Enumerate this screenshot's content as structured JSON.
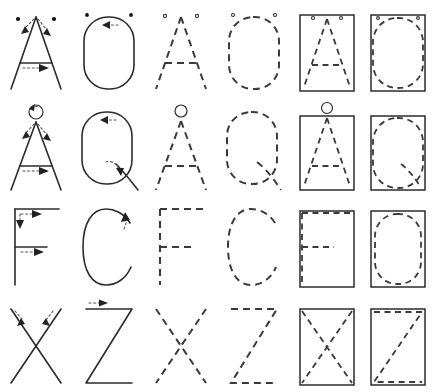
{
  "sheet": {
    "title": "Letter formation practice grid",
    "description": "Six-column by four-row worksheet showing capital letter stroke-order diagrams",
    "background_color": "#ffffff",
    "ink_color": "#2b2b2b",
    "dash_color": "#3a3a3a",
    "columns": 6,
    "rows": 4,
    "column_styles": [
      "solid-with-arrows",
      "solid-with-arrows",
      "dashed-outline",
      "dashed-outline",
      "boxed-dashed",
      "boxed-dashed"
    ]
  },
  "rows": [
    {
      "row_label": "row-1",
      "cells": [
        {
          "name": "cell-r1c1",
          "letter": "A",
          "style": "solid-with-arrows",
          "marks": "two dots at apex, two downward arrows, rightward arrow on crossbar"
        },
        {
          "name": "cell-r1c2",
          "letter": "O",
          "style": "solid-with-arrows",
          "marks": "two dots at top, leftward arrow at top"
        },
        {
          "name": "cell-r1c3",
          "letter": "A",
          "style": "dashed-outline",
          "marks": "two small dots at apex"
        },
        {
          "name": "cell-r1c4",
          "letter": "O",
          "style": "dashed-outline",
          "marks": "two small dots at top"
        },
        {
          "name": "cell-r1c5",
          "letter": "A",
          "style": "boxed-dashed",
          "marks": "solid rectangle frame with dashed letter"
        },
        {
          "name": "cell-r1c6",
          "letter": "O",
          "style": "boxed-dashed",
          "marks": "solid rectangle frame with dashed letter"
        }
      ]
    },
    {
      "row_label": "row-2",
      "cells": [
        {
          "name": "cell-r2c1",
          "letter": "Å",
          "style": "solid-with-arrows",
          "marks": "ring above apex with arrow, two downward arrows, rightward arrow on crossbar"
        },
        {
          "name": "cell-r2c2",
          "letter": "Q",
          "style": "solid-with-arrows",
          "marks": "leftward arrow at top, curved arrow on tail"
        },
        {
          "name": "cell-r2c3",
          "letter": "Å",
          "style": "dashed-outline",
          "marks": "small ring above apex"
        },
        {
          "name": "cell-r2c4",
          "letter": "Q",
          "style": "dashed-outline",
          "marks": "dashed tail stroke"
        },
        {
          "name": "cell-r2c5",
          "letter": "Å",
          "style": "boxed-dashed",
          "marks": "solid rectangle frame, ring above frame"
        },
        {
          "name": "cell-r2c6",
          "letter": "Q",
          "style": "boxed-dashed",
          "marks": "solid rectangle frame with dashed letter"
        }
      ]
    },
    {
      "row_label": "row-3",
      "cells": [
        {
          "name": "cell-r3c1",
          "letter": "F",
          "style": "solid-with-arrows",
          "marks": "downward arrow on stem, two rightward arrows on bars"
        },
        {
          "name": "cell-r3c2",
          "letter": "C",
          "style": "solid-with-arrows",
          "marks": "upward curving arrow at top right"
        },
        {
          "name": "cell-r3c3",
          "letter": "F",
          "style": "dashed-outline",
          "marks": ""
        },
        {
          "name": "cell-r3c4",
          "letter": "C",
          "style": "dashed-outline",
          "marks": ""
        },
        {
          "name": "cell-r3c5",
          "letter": "F",
          "style": "boxed-dashed",
          "marks": "solid rectangle frame with dashed letter"
        },
        {
          "name": "cell-r3c6",
          "letter": "O",
          "style": "boxed-dashed",
          "marks": "solid rectangle frame with dashed letter"
        }
      ]
    },
    {
      "row_label": "row-4",
      "cells": [
        {
          "name": "cell-r4c1",
          "letter": "X",
          "style": "solid-with-arrows",
          "marks": "two downward-inward arrows at top"
        },
        {
          "name": "cell-r4c2",
          "letter": "Z",
          "style": "solid-with-arrows",
          "marks": "rightward arrow on top bar"
        },
        {
          "name": "cell-r4c3",
          "letter": "X",
          "style": "dashed-outline",
          "marks": ""
        },
        {
          "name": "cell-r4c4",
          "letter": "Z",
          "style": "dashed-outline",
          "marks": ""
        },
        {
          "name": "cell-r4c5",
          "letter": "X",
          "style": "boxed-dashed",
          "marks": "solid rectangle frame with dashed diagonals"
        },
        {
          "name": "cell-r4c6",
          "letter": "Z",
          "style": "boxed-dashed",
          "marks": "solid rectangle frame with dashed letter"
        }
      ]
    }
  ]
}
